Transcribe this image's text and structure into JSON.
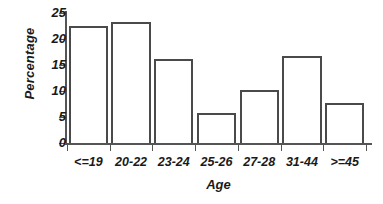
{
  "chart_data": {
    "type": "bar",
    "title": "",
    "xlabel": "Age",
    "ylabel": "Percentage",
    "categories": [
      "<=19",
      "20-22",
      "23-24",
      "25-26",
      "27-28",
      "31-44",
      ">=45"
    ],
    "values": [
      22.5,
      23.2,
      16.1,
      5.8,
      10.2,
      16.8,
      7.7
    ],
    "ylim": [
      0,
      25
    ],
    "yticks": [
      0,
      5,
      10,
      15,
      20,
      25
    ],
    "ytick_labels": [
      "0",
      "5",
      "10",
      "15",
      "20",
      "25"
    ],
    "grid": false,
    "legend": null,
    "bar_fill_color": "#ffffff",
    "bar_edge_color": "#4a4a4a",
    "axis_color": "#555555",
    "background_color": "#ffffff"
  }
}
